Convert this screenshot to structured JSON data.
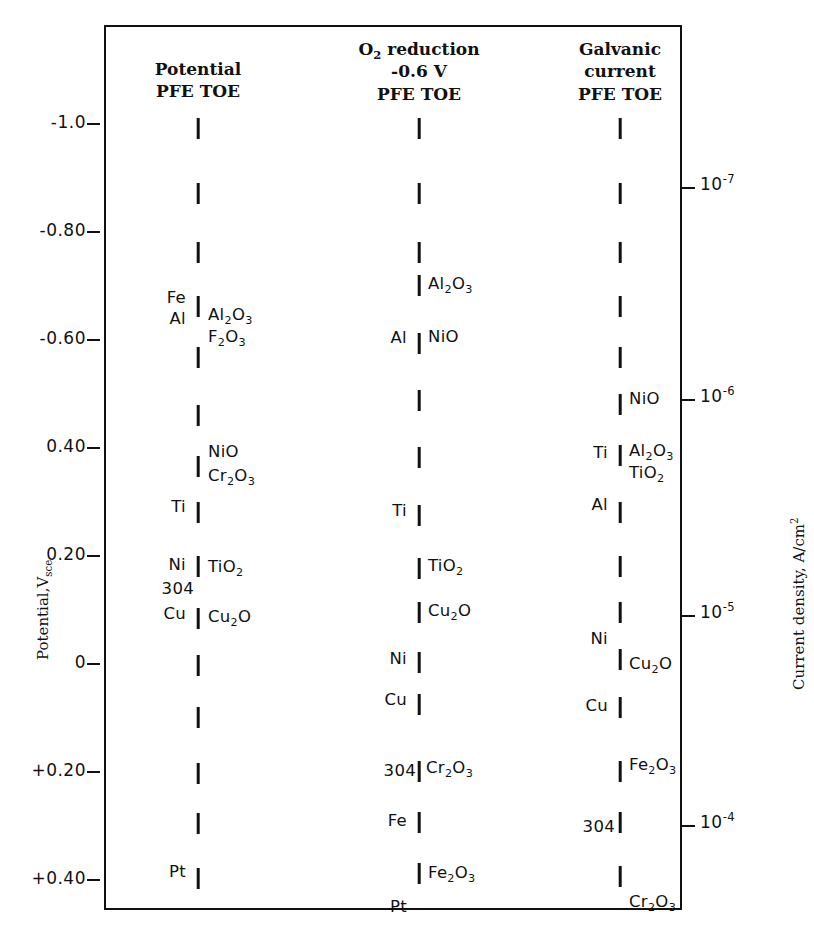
{
  "figure": {
    "left_axis": {
      "title": "Potential,V",
      "title_sub": "sce",
      "ticks": [
        {
          "label": "-1.0",
          "value": -1.0,
          "y": 124
        },
        {
          "label": "-0.80",
          "value": -0.8,
          "y": 232
        },
        {
          "label": "-0.60",
          "value": -0.6,
          "y": 340
        },
        {
          "label": "0.40",
          "value": -0.4,
          "y": 448
        },
        {
          "label": "0.20",
          "value": -0.2,
          "y": 556
        },
        {
          "label": "0",
          "value": 0.0,
          "y": 664
        },
        {
          "label": "+0.20",
          "value": 0.2,
          "y": 772
        },
        {
          "label": "+0.40",
          "value": 0.4,
          "y": 880
        }
      ]
    },
    "right_axis": {
      "title": "Current density, A/cm",
      "title_sup": "2",
      "ticks": [
        {
          "mantissa": "10",
          "exponent": "-7",
          "value": 1e-07,
          "y": 188
        },
        {
          "mantissa": "10",
          "exponent": "-6",
          "value": 1e-06,
          "y": 400
        },
        {
          "mantissa": "10",
          "exponent": "-5",
          "value": 1e-05,
          "y": 616
        },
        {
          "mantissa": "10",
          "exponent": "-4",
          "value": 0.0001,
          "y": 826
        }
      ]
    },
    "columns": [
      {
        "id": "potential",
        "name": "potential-column",
        "x": 198,
        "header_lines": [
          "Potential",
          "PFE TOE"
        ],
        "header_y": 58,
        "ticks_y": [
          128,
          193,
          252,
          306,
          357,
          415,
          466,
          512,
          566,
          618,
          665,
          717,
          773,
          823,
          878
        ],
        "labels": [
          {
            "text": "Fe",
            "side": "left",
            "y": 299,
            "dx": -12
          },
          {
            "text": "Al",
            "side": "left",
            "y": 320,
            "dx": -12
          },
          {
            "text": "Ti",
            "side": "left",
            "y": 508,
            "dx": -12
          },
          {
            "text": "Ni",
            "side": "left",
            "y": 566,
            "dx": -12
          },
          {
            "text": "304",
            "side": "left",
            "y": 590,
            "dx": -4
          },
          {
            "text": "Cu",
            "side": "left",
            "y": 615,
            "dx": -12
          },
          {
            "text": "Pt",
            "side": "left",
            "y": 873,
            "dx": -12
          },
          {
            "text": "Al2O3",
            "side": "right",
            "y": 316,
            "dx": 10,
            "formula": [
              [
                "Al",
                0
              ],
              [
                "2",
                1
              ],
              [
                "O",
                0
              ],
              [
                "3",
                1
              ]
            ]
          },
          {
            "text": "F2O3",
            "side": "right",
            "y": 338,
            "dx": 10,
            "formula": [
              [
                "F",
                0
              ],
              [
                "2",
                1
              ],
              [
                "O",
                0
              ],
              [
                "3",
                1
              ]
            ]
          },
          {
            "text": "NiO",
            "side": "right",
            "y": 453,
            "dx": 10,
            "formula": [
              [
                "NiO",
                0
              ]
            ]
          },
          {
            "text": "Cr2O3",
            "side": "right",
            "y": 477,
            "dx": 10,
            "formula": [
              [
                "Cr",
                0
              ],
              [
                "2",
                1
              ],
              [
                "O",
                0
              ],
              [
                "3",
                1
              ]
            ]
          },
          {
            "text": "TiO2",
            "side": "right",
            "y": 568,
            "dx": 10,
            "formula": [
              [
                "TiO",
                0
              ],
              [
                "2",
                1
              ]
            ]
          },
          {
            "text": "Cu2O",
            "side": "right",
            "y": 618,
            "dx": 10,
            "formula": [
              [
                "Cu",
                0
              ],
              [
                "2",
                1
              ],
              [
                "O",
                0
              ]
            ]
          }
        ]
      },
      {
        "id": "o2-reduction",
        "name": "o2-reduction-column",
        "x": 419,
        "header_lines": [
          "O2 reduction",
          "-0.6 V",
          "PFE TOE"
        ],
        "header_y": 38,
        "ticks_y": [
          128,
          193,
          252,
          285,
          343,
          400,
          457,
          515,
          568,
          612,
          662,
          704,
          771,
          822,
          873
        ],
        "labels": [
          {
            "text": "Al",
            "side": "left",
            "y": 339,
            "dx": -12
          },
          {
            "text": "Ti",
            "side": "left",
            "y": 512,
            "dx": -12
          },
          {
            "text": "Ni",
            "side": "left",
            "y": 660,
            "dx": -12
          },
          {
            "text": "Cu",
            "side": "left",
            "y": 701,
            "dx": -12
          },
          {
            "text": "304",
            "side": "left",
            "y": 772,
            "dx": -3
          },
          {
            "text": "Fe",
            "side": "left",
            "y": 822,
            "dx": -12
          },
          {
            "text": "Pt",
            "side": "left",
            "y": 908,
            "dx": -12
          },
          {
            "text": "Al2O3",
            "side": "right",
            "y": 285,
            "dx": 9,
            "formula": [
              [
                "Al",
                0
              ],
              [
                "2",
                1
              ],
              [
                "O",
                0
              ],
              [
                "3",
                1
              ]
            ]
          },
          {
            "text": "NiO",
            "side": "right",
            "y": 338,
            "dx": 9,
            "formula": [
              [
                "NiO",
                0
              ]
            ]
          },
          {
            "text": "TiO2",
            "side": "right",
            "y": 567,
            "dx": 9,
            "formula": [
              [
                "TiO",
                0
              ],
              [
                "2",
                1
              ]
            ]
          },
          {
            "text": "Cu2O",
            "side": "right",
            "y": 612,
            "dx": 9,
            "formula": [
              [
                "Cu",
                0
              ],
              [
                "2",
                1
              ],
              [
                "O",
                0
              ]
            ]
          },
          {
            "text": "Cr2O3",
            "side": "right",
            "y": 769,
            "dx": 7,
            "formula": [
              [
                "Cr",
                0
              ],
              [
                "2",
                1
              ],
              [
                "O",
                0
              ],
              [
                "3",
                1
              ]
            ]
          },
          {
            "text": "Fe2O3",
            "side": "right",
            "y": 874,
            "dx": 9,
            "formula": [
              [
                "Fe",
                0
              ],
              [
                "2",
                1
              ],
              [
                "O",
                0
              ],
              [
                "3",
                1
              ]
            ]
          }
        ]
      },
      {
        "id": "galvanic-current",
        "name": "galvanic-current-column",
        "x": 620,
        "header_lines": [
          "Galvanic",
          "current",
          "PFE TOE"
        ],
        "header_y": 38,
        "ticks_y": [
          128,
          193,
          252,
          306,
          357,
          404,
          455,
          512,
          566,
          612,
          659,
          707,
          771,
          822,
          876
        ],
        "labels": [
          {
            "text": "Ti",
            "side": "left",
            "y": 454,
            "dx": -12
          },
          {
            "text": "Al",
            "side": "left",
            "y": 506,
            "dx": -12
          },
          {
            "text": "Ni",
            "side": "left",
            "y": 640,
            "dx": -12
          },
          {
            "text": "Cu",
            "side": "left",
            "y": 707,
            "dx": -12
          },
          {
            "text": "304",
            "side": "left",
            "y": 828,
            "dx": -5
          },
          {
            "text": "NiO",
            "side": "right",
            "y": 400,
            "dx": 9,
            "formula": [
              [
                "NiO",
                0
              ]
            ]
          },
          {
            "text": "Al2O3",
            "side": "right",
            "y": 452,
            "dx": 9,
            "formula": [
              [
                "Al",
                0
              ],
              [
                "2",
                1
              ],
              [
                "O",
                0
              ],
              [
                "3",
                1
              ]
            ]
          },
          {
            "text": "TiO2",
            "side": "right",
            "y": 474,
            "dx": 9,
            "formula": [
              [
                "TiO",
                0
              ],
              [
                "2",
                1
              ]
            ]
          },
          {
            "text": "Cu2O",
            "side": "right",
            "y": 665,
            "dx": 9,
            "formula": [
              [
                "Cu",
                0
              ],
              [
                "2",
                1
              ],
              [
                "O",
                0
              ]
            ]
          },
          {
            "text": "Fe2O3",
            "side": "right",
            "y": 766,
            "dx": 9,
            "formula": [
              [
                "Fe",
                0
              ],
              [
                "2",
                1
              ],
              [
                "O",
                0
              ],
              [
                "3",
                1
              ]
            ]
          },
          {
            "text": "Cr2O3",
            "side": "right",
            "y": 903,
            "dx": 9,
            "formula": [
              [
                "Cr",
                0
              ],
              [
                "2",
                1
              ],
              [
                "O",
                0
              ],
              [
                "3",
                1
              ]
            ]
          }
        ]
      }
    ]
  },
  "chart_data": {
    "type": "scatter",
    "title": "",
    "ylabel": "Potential, V_sce",
    "y2label": "Current density, A/cm^2",
    "ylim": [
      -1.12,
      0.52
    ],
    "y2lim": [
      3.2e-08,
      0.00026
    ],
    "yticks": [
      -1.0,
      -0.8,
      -0.6,
      -0.4,
      -0.2,
      0,
      0.2,
      0.4
    ],
    "ytick_labels": [
      "-1.0",
      "-0.80",
      "-0.60",
      "0.40",
      "0.20",
      "0",
      "+0.20",
      "+0.40"
    ],
    "y2ticks": [
      1e-07,
      1e-06,
      1e-05,
      0.0001
    ],
    "y2tick_labels": [
      "10^-7",
      "10^-6",
      "10^-5",
      "10^-4"
    ],
    "grid": false,
    "legend": "none",
    "series": [
      {
        "name": "Potential PFE TOE",
        "points": [
          {
            "label": "",
            "potential": -0.99
          },
          {
            "label": "",
            "potential": -0.87
          },
          {
            "label": "",
            "potential": -0.76
          },
          {
            "label": "Fe/Al/Al2O3/F2O3",
            "potential": -0.66
          },
          {
            "label": "",
            "potential": -0.57
          },
          {
            "label": "",
            "potential": -0.46
          },
          {
            "label": "NiO/Cr2O3",
            "potential": -0.37
          },
          {
            "label": "Ti",
            "potential": -0.28
          },
          {
            "label": "",
            "potential": -0.18
          },
          {
            "label": "Ni/TiO2",
            "potential": -0.09
          },
          {
            "label": "304",
            "potential": 0.0
          },
          {
            "label": "Cu/Cu2O",
            "potential": 0.1
          },
          {
            "label": "",
            "potential": 0.2
          },
          {
            "label": "",
            "potential": 0.29
          },
          {
            "label": "Pt",
            "potential": 0.4
          }
        ]
      },
      {
        "name": "O2 reduction -0.6 V PFE TOE",
        "points": [
          {
            "label": "",
            "potential": -0.99
          },
          {
            "label": "",
            "potential": -0.87
          },
          {
            "label": "",
            "potential": -0.76
          },
          {
            "label": "Al2O3",
            "potential": -0.7
          },
          {
            "label": "Al/NiO",
            "potential": -0.59
          },
          {
            "label": "",
            "potential": -0.49
          },
          {
            "label": "",
            "potential": -0.38
          },
          {
            "label": "Ti",
            "potential": -0.28
          },
          {
            "label": "TiO2",
            "potential": -0.18
          },
          {
            "label": "Cu2O",
            "potential": -0.1
          },
          {
            "label": "Ni",
            "potential": 0.0
          },
          {
            "label": "Cu",
            "potential": 0.07
          },
          {
            "label": "304/Cr2O3",
            "potential": 0.2
          },
          {
            "label": "Fe",
            "potential": 0.29
          },
          {
            "label": "Fe2O3/Pt",
            "potential": 0.39
          }
        ]
      },
      {
        "name": "Galvanic current PFE TOE",
        "points": [
          {
            "label": "",
            "potential": -0.99
          },
          {
            "label": "",
            "potential": -0.87
          },
          {
            "label": "",
            "potential": -0.76
          },
          {
            "label": "",
            "potential": -0.66
          },
          {
            "label": "",
            "potential": -0.57
          },
          {
            "label": "NiO",
            "potential": -0.48
          },
          {
            "label": "Ti/Al2O3/TiO2",
            "potential": -0.39
          },
          {
            "label": "Al",
            "potential": -0.28
          },
          {
            "label": "",
            "potential": -0.18
          },
          {
            "label": "",
            "potential": -0.1
          },
          {
            "label": "Ni",
            "potential": -0.01
          },
          {
            "label": "Cu/Cu2O",
            "potential": 0.08
          },
          {
            "label": "Fe2O3",
            "potential": 0.2
          },
          {
            "label": "",
            "potential": 0.29
          },
          {
            "label": "304/Cr2O3",
            "potential": 0.4
          }
        ]
      }
    ]
  }
}
